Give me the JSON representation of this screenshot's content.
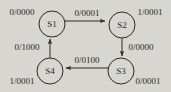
{
  "diagram": {
    "type": "state-transition-diagram",
    "title": "",
    "background_color": "#d8d6d0",
    "ink_color": "#2a2a2a",
    "states": [
      {
        "id": "S1",
        "label": "S1",
        "cx": 52,
        "cy": 24,
        "r": 13
      },
      {
        "id": "S2",
        "label": "S2",
        "cx": 122,
        "cy": 25,
        "r": 13
      },
      {
        "id": "S3",
        "label": "S3",
        "cx": 121,
        "cy": 71,
        "r": 13
      },
      {
        "id": "S4",
        "label": "S4",
        "cx": 50,
        "cy": 71,
        "r": 13
      }
    ],
    "transitions": [
      {
        "id": "s1-to-s2",
        "from": "S1",
        "to": "S2",
        "label": "0/0001",
        "input": "0",
        "output": "0001",
        "label_x": 87,
        "label_y": 16
      },
      {
        "id": "s2-to-s3",
        "from": "S2",
        "to": "S3",
        "label": "0/0000",
        "input": "0",
        "output": "0000",
        "label_x": 140,
        "label_y": 48
      },
      {
        "id": "s3-to-s4",
        "from": "S3",
        "to": "S4",
        "label": "0/0100",
        "input": "0",
        "output": "0100",
        "label_x": 86,
        "label_y": 62
      },
      {
        "id": "s4-to-s1",
        "from": "S4",
        "to": "S1",
        "label": "0/1000",
        "input": "0",
        "output": "1000",
        "label_x": 26,
        "label_y": 47
      }
    ],
    "corner_labels": [
      {
        "id": "s1-corner-label",
        "state": "S1",
        "label": "0/0000",
        "input": "0",
        "output": "0000",
        "position": "top-left",
        "label_x": 22,
        "label_y": 12
      },
      {
        "id": "s2-corner-label",
        "state": "S2",
        "label": "1/0001",
        "input": "1",
        "output": "0001",
        "position": "top-right",
        "label_x": 150,
        "label_y": 12
      },
      {
        "id": "s3-corner-label",
        "state": "S3",
        "label": "0/0001",
        "input": "0",
        "output": "0001",
        "position": "bottom-right",
        "label_x": 148,
        "label_y": 80
      },
      {
        "id": "s4-corner-label",
        "state": "S4",
        "label": "1/0001",
        "input": "1",
        "output": "0001",
        "position": "bottom-left",
        "label_x": 22,
        "label_y": 80
      }
    ]
  }
}
